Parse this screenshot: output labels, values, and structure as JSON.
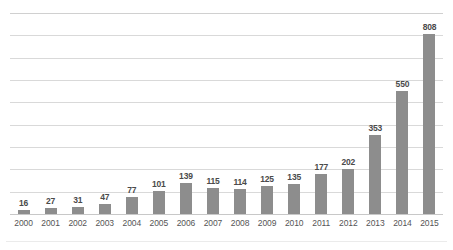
{
  "chart_data": {
    "type": "bar",
    "title": "",
    "subtitle": "",
    "xlabel": "",
    "ylabel": "",
    "categories": [
      "2000",
      "2001",
      "2002",
      "2003",
      "2004",
      "2005",
      "2006",
      "2007",
      "2008",
      "2009",
      "2010",
      "2011",
      "2012",
      "2013",
      "2014",
      "2015"
    ],
    "values": [
      16,
      27,
      31,
      47,
      77,
      101,
      139,
      115,
      114,
      125,
      135,
      177,
      202,
      353,
      550,
      808
    ],
    "data_labels": [
      "16",
      "27",
      "31",
      "47",
      "77",
      "101",
      "139",
      "115",
      "114",
      "125",
      "135",
      "177",
      "202",
      "353",
      "550",
      "808"
    ],
    "series": [
      {
        "name": "",
        "values": [
          16,
          27,
          31,
          47,
          77,
          101,
          139,
          115,
          114,
          125,
          135,
          177,
          202,
          353,
          550,
          808
        ]
      }
    ],
    "ylim": [
      0,
      900
    ],
    "ytick_values": [
      0,
      100,
      200,
      300,
      400,
      500,
      600,
      700,
      800,
      900
    ],
    "ytick_labels": [],
    "y_axis_visible": false,
    "grid": true,
    "grid_orientation": "horizontal",
    "legend": false,
    "legend_position": "none",
    "bar_color": "#8d8d8d",
    "gridline_color": "#d9d9d9",
    "label_color": "#4a4a4a",
    "tick_color": "#555555",
    "background_color": "#ffffff"
  }
}
